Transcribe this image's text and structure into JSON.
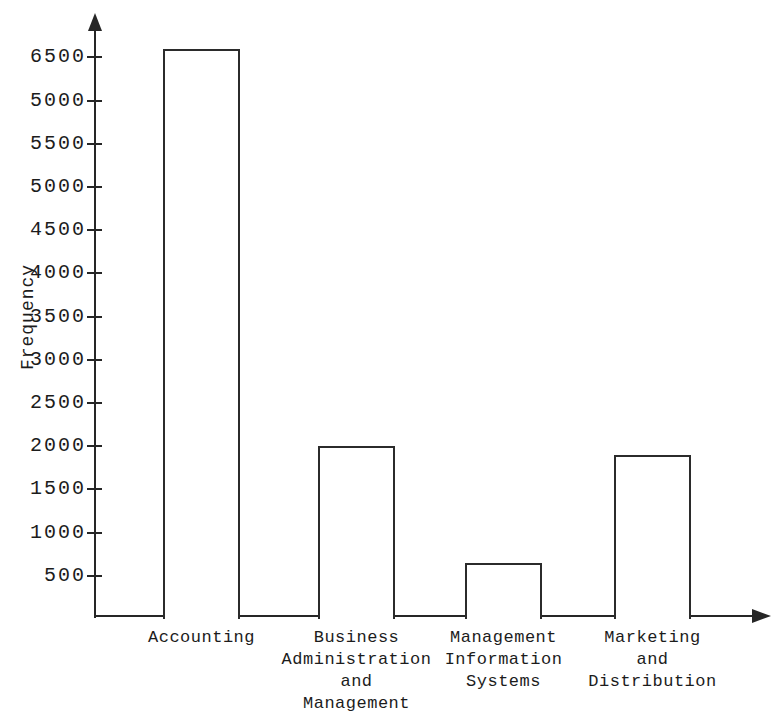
{
  "chart_data": {
    "type": "bar",
    "title": "",
    "xlabel": "",
    "ylabel": "Frequency",
    "categories": [
      {
        "name": "Accounting",
        "lines": [
          "Accounting"
        ]
      },
      {
        "name": "Business Administration and Management",
        "lines": [
          "Business",
          "Administration",
          "and",
          "Management"
        ]
      },
      {
        "name": "Management Information Systems",
        "lines": [
          "Management",
          "Information",
          "Systems"
        ]
      },
      {
        "name": "Marketing and Distribution",
        "lines": [
          "Marketing",
          "and",
          "Distribution"
        ]
      }
    ],
    "values": [
      6600,
      2000,
      650,
      1900
    ],
    "ylim": [
      0,
      6900
    ],
    "ytick_interval": 500,
    "yticks": [
      {
        "value": 500,
        "label": "500"
      },
      {
        "value": 1000,
        "label": "1000"
      },
      {
        "value": 1500,
        "label": "1500"
      },
      {
        "value": 2000,
        "label": "2000"
      },
      {
        "value": 2500,
        "label": "2500"
      },
      {
        "value": 3000,
        "label": "3000"
      },
      {
        "value": 3500,
        "label": "3500"
      },
      {
        "value": 4000,
        "label": "4000"
      },
      {
        "value": 4500,
        "label": "4500"
      },
      {
        "value": 5000,
        "label": "5000"
      },
      {
        "value": 5500,
        "label": "5500"
      },
      {
        "value": 6000,
        "label": "5000"
      },
      {
        "value": 6500,
        "label": "6500"
      }
    ],
    "grid": false,
    "legend": "none",
    "bar_fill": "#ffffff",
    "axis_color": "#262626",
    "background": "#ffffff"
  }
}
